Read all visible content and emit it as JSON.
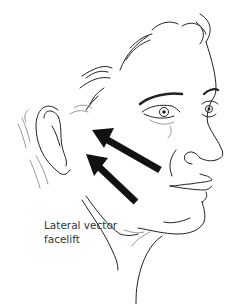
{
  "figure": {
    "caption_lines": [
      "Lateral vector",
      "facelift"
    ],
    "arrows": [
      {
        "name": "upper-arrow",
        "direction": "up-left"
      },
      {
        "name": "lower-arrow",
        "direction": "up-left"
      }
    ],
    "colors": {
      "line": "#222222",
      "arrow": "#111111",
      "background": "#ffffff",
      "caption": "#333333"
    }
  }
}
